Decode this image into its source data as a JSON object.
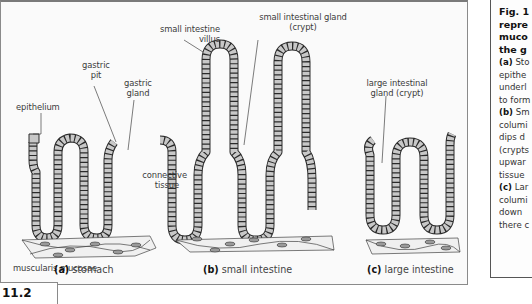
{
  "figure": {
    "number": "11.2",
    "labels": {
      "epithelium": "epithelium",
      "gastric_pit": [
        "gastric",
        "pit"
      ],
      "gastric_gland": [
        "gastric",
        "gland"
      ],
      "connective_tissue": [
        "connective",
        "tissue"
      ],
      "muscularis_mucosae": "muscularis mucosae",
      "small_intestine_villus": [
        "small intestine",
        "villus"
      ],
      "small_intestinal_gland": [
        "small intestinal gland",
        "(crypt)"
      ],
      "large_intestinal_gland": [
        "large intestinal",
        "gland (crypt)"
      ]
    },
    "panels": [
      {
        "letter": "(a)",
        "name": "stomach"
      },
      {
        "letter": "(b)",
        "name": "small intestine"
      },
      {
        "letter": "(c)",
        "name": "large intestine"
      }
    ]
  },
  "caption_panel": {
    "title_lines": [
      "Fig. 1",
      "repre",
      "muco",
      "the g"
    ],
    "body_lines": [
      {
        "bold": "(a)",
        "text": " Sto"
      },
      {
        "bold": "",
        "text": "epithe"
      },
      {
        "bold": "",
        "text": "underl"
      },
      {
        "bold": "",
        "text": "to form"
      },
      {
        "bold": "(b)",
        "text": " Sm"
      },
      {
        "bold": "",
        "text": "columi"
      },
      {
        "bold": "",
        "text": "dips d"
      },
      {
        "bold": "",
        "text": "(crypts"
      },
      {
        "bold": "",
        "text": "upwar"
      },
      {
        "bold": "",
        "text": "tissue"
      },
      {
        "bold": "(c)",
        "text": " Lar"
      },
      {
        "bold": "",
        "text": "columi"
      },
      {
        "bold": "",
        "text": "down"
      },
      {
        "bold": "",
        "text": "there c"
      }
    ]
  },
  "colors": {
    "cell_fill": "#c8c8c8",
    "outline": "#2a2a2a",
    "muscle_fill": "#eeeeee",
    "nucleus": "#9a9a9a"
  }
}
